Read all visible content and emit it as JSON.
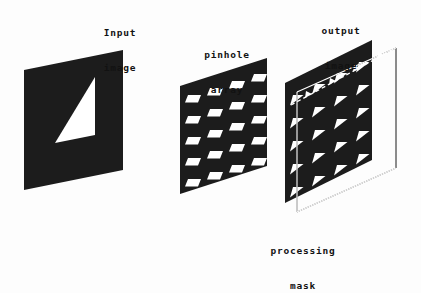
{
  "figure": {
    "type": "optical-system-diagram",
    "background_color": "#fdfdfd",
    "ink_color": "#1a1a1a",
    "panel_fill": "#1c1c1c",
    "aperture_color": "#ffffff"
  },
  "labels": {
    "input": {
      "line1": "Input",
      "line2": "image"
    },
    "pinhole": {
      "line1": "pinhole",
      "line2": "array"
    },
    "output": {
      "line1": "output",
      "line2": "image"
    },
    "mask": {
      "line1": "processing",
      "line2": "mask"
    }
  },
  "panels": {
    "input_image": {
      "name": "input image",
      "shape": "parallelogram",
      "fill": "#1c1c1c",
      "aperture_shape": "right-triangle",
      "aperture_count": 1
    },
    "pinhole_array": {
      "name": "pinhole array",
      "shape": "parallelogram",
      "fill": "#1c1c1c",
      "aperture_shape": "rectangle",
      "grid_columns": 4,
      "grid_rows": 5,
      "aperture_count": 20
    },
    "output_image": {
      "name": "output image",
      "shape": "parallelogram",
      "fill": "#1c1c1c",
      "aperture_shape": "right-triangle",
      "grid_columns": 4,
      "grid_rows": 5,
      "aperture_count": 20
    },
    "processing_mask": {
      "name": "processing mask",
      "shape": "parallelogram-outline",
      "fill": "none",
      "stroke": "#1a1a1a",
      "stroke_style": "thin"
    }
  },
  "annotations": {
    "ray_arrow": {
      "name": "ray direction arrow",
      "style": "dashed",
      "direction": "up-right",
      "arrowhead_count": 4
    }
  }
}
